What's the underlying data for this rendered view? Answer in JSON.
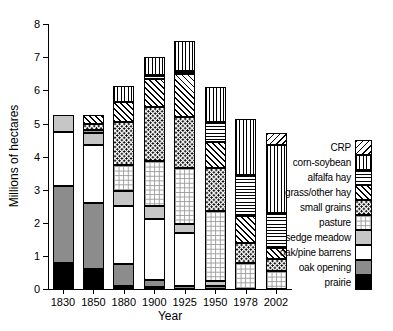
{
  "chart_data": {
    "type": "bar",
    "stacked": true,
    "title": "",
    "xlabel": "Year",
    "ylabel": "Millions of hectares",
    "ylim": [
      0,
      8
    ],
    "yticks": [
      "0",
      "1",
      "2",
      "3",
      "4",
      "5",
      "6",
      "7",
      "8"
    ],
    "grid": false,
    "legend_position": "right",
    "categories": [
      "1830",
      "1850",
      "1880",
      "1900",
      "1925",
      "1950",
      "1978",
      "2002"
    ],
    "series": [
      {
        "name": "prairie",
        "pattern": "solid-black",
        "values": [
          0.8,
          0.6,
          0.1,
          0.05,
          0,
          0,
          0,
          0
        ]
      },
      {
        "name": "oak opening",
        "pattern": "solid-darkgray",
        "values": [
          2.3,
          2.0,
          0.65,
          0.2,
          0.1,
          0.1,
          0,
          0
        ]
      },
      {
        "name": "oak/pine barrens",
        "pattern": "solid-white",
        "values": [
          1.65,
          1.75,
          1.75,
          1.85,
          1.6,
          0,
          0,
          0
        ]
      },
      {
        "name": "sedge meadow",
        "pattern": "solid-lightgray",
        "values": [
          0.5,
          0.35,
          0.45,
          0.4,
          0.25,
          0.15,
          0,
          0
        ]
      },
      {
        "name": "pasture",
        "pattern": "grid",
        "values": [
          0,
          0.1,
          0.8,
          1.35,
          1.7,
          2.1,
          0.8,
          0.55
        ]
      },
      {
        "name": "small grains",
        "pattern": "dots",
        "values": [
          0,
          0.2,
          1.3,
          1.65,
          1.55,
          1.3,
          0.6,
          0.35
        ]
      },
      {
        "name": "grass/other hay",
        "pattern": "diag-down",
        "values": [
          0,
          0.25,
          0.6,
          0.85,
          1.3,
          0.8,
          0.8,
          0.35
        ]
      },
      {
        "name": "alfalfa hay",
        "pattern": "horiz",
        "values": [
          0,
          0,
          0,
          0.1,
          0.1,
          0.6,
          1.25,
          1.05
        ]
      },
      {
        "name": "corn-soybean",
        "pattern": "vert",
        "values": [
          0,
          0,
          0.5,
          0.55,
          0.9,
          1.05,
          1.7,
          2.05
        ]
      },
      {
        "name": "CRP",
        "pattern": "diag-up",
        "values": [
          0,
          0,
          0,
          0,
          0,
          0,
          0,
          0.35
        ]
      }
    ],
    "legend_items_top_to_bottom": [
      "CRP",
      "corn-soybean",
      "alfalfa hay",
      "grass/other hay",
      "small grains",
      "pasture",
      "sedge meadow",
      "oak/pine barrens",
      "oak opening",
      "prairie"
    ],
    "totals_by_year": [
      5.25,
      5.25,
      6.15,
      7.0,
      7.5,
      6.1,
      5.15,
      4.7
    ],
    "colors": {
      "foreground": "#000000",
      "background": "#ffffff",
      "oak_opening_gray": "#8c8c8c",
      "sedge_meadow_gray": "#c6c6c6",
      "pasture_grid_gray": "#9b9b9b"
    }
  }
}
